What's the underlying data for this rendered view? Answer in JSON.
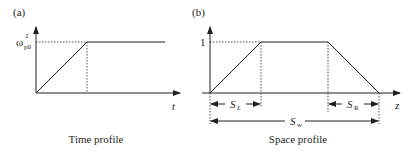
{
  "panels": [
    {
      "id": "a",
      "label": "(a)",
      "title": "Time profile",
      "y_tick_label_base": "ω",
      "y_tick_label_sup": "2",
      "y_tick_label_sub": "p0",
      "x_axis_label": "t"
    },
    {
      "id": "b",
      "label": "(b)",
      "title": "Space profile",
      "y_tick_label": "1",
      "x_axis_label": "z",
      "dimensions": {
        "left_ramp": {
          "base": "S",
          "sub": "L"
        },
        "right_ramp": {
          "base": "S",
          "sub": "R"
        },
        "width": {
          "base": "S",
          "sub": "w"
        }
      }
    }
  ],
  "colors": {
    "line": "#231f20",
    "background": "#ffffff"
  }
}
